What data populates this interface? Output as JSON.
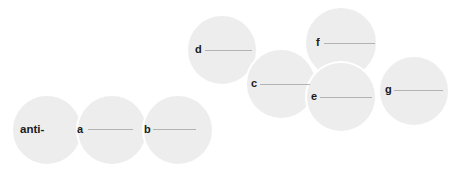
{
  "figure": {
    "type": "micrograph-panel-overlay",
    "background_color": "#ffffff",
    "disc_fill_color": "#ededed",
    "disc_border_color": "#ffffff",
    "label_color": "#1a1a1a",
    "scalebar_color": "#b3b3b3",
    "panels": [
      {
        "id": "anti",
        "label": "anti-",
        "has_scalebar": false,
        "cx": 47,
        "cy": 130,
        "r": 36,
        "label_x": 20,
        "label_y": 124,
        "z": 1
      },
      {
        "id": "a",
        "label": "a",
        "has_scalebar": true,
        "cx": 112,
        "cy": 130,
        "r": 36,
        "label_x": 77,
        "label_y": 124,
        "bar_x": 88,
        "bar_y": 129,
        "bar_w": 45,
        "z": 2
      },
      {
        "id": "b",
        "label": "b",
        "has_scalebar": true,
        "cx": 178,
        "cy": 130,
        "r": 36,
        "label_x": 144,
        "label_y": 124,
        "bar_x": 153,
        "bar_y": 129,
        "bar_w": 43,
        "z": 3
      },
      {
        "id": "d",
        "label": "d",
        "has_scalebar": true,
        "cx": 222,
        "cy": 50,
        "r": 36,
        "label_x": 195,
        "label_y": 44,
        "bar_x": 205,
        "bar_y": 50,
        "bar_w": 47,
        "z": 4
      },
      {
        "id": "c",
        "label": "c",
        "has_scalebar": true,
        "cx": 281,
        "cy": 84,
        "r": 36,
        "label_x": 251,
        "label_y": 78,
        "bar_x": 260,
        "bar_y": 84,
        "bar_w": 50,
        "z": 5
      },
      {
        "id": "f",
        "label": "f",
        "has_scalebar": true,
        "cx": 341,
        "cy": 43,
        "r": 37,
        "label_x": 316,
        "label_y": 37,
        "bar_x": 324,
        "bar_y": 43,
        "bar_w": 51,
        "z": 6
      },
      {
        "id": "e",
        "label": "e",
        "has_scalebar": true,
        "cx": 341,
        "cy": 97,
        "r": 36,
        "label_x": 311,
        "label_y": 91,
        "bar_x": 320,
        "bar_y": 97,
        "bar_w": 52,
        "z": 7
      },
      {
        "id": "g",
        "label": "g",
        "has_scalebar": true,
        "cx": 414,
        "cy": 91,
        "r": 36,
        "label_x": 385,
        "label_y": 84,
        "bar_x": 394,
        "bar_y": 90,
        "bar_w": 49,
        "z": 8
      }
    ]
  }
}
